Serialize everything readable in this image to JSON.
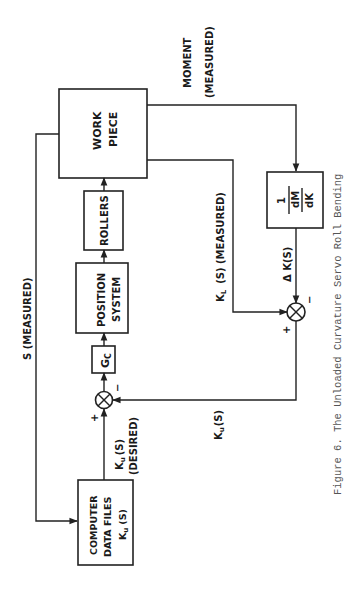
{
  "diagram": {
    "type": "block-diagram",
    "orientation": "rotated-90-ccw",
    "blocks": {
      "work_piece": [
        "WORK",
        "PIECE"
      ],
      "rollers": "ROLLERS",
      "position_system": [
        "POSITION",
        "SYSTEM"
      ],
      "controller": {
        "main": "G",
        "sub": "C"
      },
      "computer_data_files": [
        "COMPUTER",
        "DATA FILES",
        "K",
        "u",
        "(S)"
      ],
      "moment_gain": {
        "numerator": "1",
        "denominator_top": "dM",
        "denominator_bottom": "dK"
      }
    },
    "signals": {
      "s_measured": "S (MEASURED)",
      "moment": [
        "MOMENT",
        "(MEASURED)"
      ],
      "kl_measured": {
        "K": "K",
        "sub": "L",
        "rest": "(S) (MEASURED)"
      },
      "delta_k": "Δ K(S)",
      "ku_desired": {
        "K": "K",
        "sub": "u",
        "rest": "(S)",
        "desc": "(DESIRED)"
      },
      "ku_feedback": {
        "K": "K",
        "sub": "u",
        "rest": "(S)"
      }
    },
    "summing_junctions": {
      "upper": {
        "plus": "+",
        "minus": "−"
      },
      "lower": {
        "plus": "+",
        "minus": "−"
      }
    },
    "caption": "Figure 6.   The Unloaded Curvature Servo Roll Bending"
  }
}
